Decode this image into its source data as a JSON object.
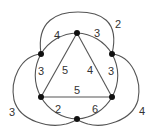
{
  "diagram": {
    "type": "weighted-graph",
    "nodes": [
      {
        "id": "T",
        "x": 77,
        "y": 33
      },
      {
        "id": "UL",
        "x": 41,
        "y": 54
      },
      {
        "id": "UR",
        "x": 112,
        "y": 54
      },
      {
        "id": "LL",
        "x": 41,
        "y": 97
      },
      {
        "id": "LR",
        "x": 112,
        "y": 97
      },
      {
        "id": "B",
        "x": 77,
        "y": 119
      }
    ],
    "edges": {
      "t_ul": "4",
      "t_ur": "3",
      "ul_ll": "3",
      "ur_lr": "3",
      "ll_b": "2",
      "lr_b": "6",
      "t_ll": "5",
      "t_lr": "4",
      "ll_lr": "5",
      "ul_ur_outer": "2",
      "ul_b_outer": "3",
      "ur_b_outer": "4"
    }
  }
}
